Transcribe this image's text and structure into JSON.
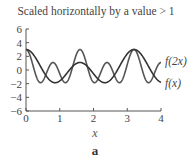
{
  "chart_data": {
    "type": "line",
    "title": "Scaled horizontally by a value > 1",
    "xlabel": "x",
    "ylabel": "",
    "caption": "a",
    "xlim": [
      0,
      4
    ],
    "ylim": [
      -6,
      6
    ],
    "x_ticks": [
      0,
      1,
      2,
      3,
      4
    ],
    "x_tick_labels": [
      "0",
      "1",
      "2",
      "3",
      "4"
    ],
    "y_ticks": [
      6,
      4,
      2,
      0,
      -2,
      -4,
      -6
    ],
    "y_tick_labels": [
      "6",
      "4",
      "2",
      "0",
      "−2",
      "−4",
      "−6"
    ],
    "grid": false,
    "legend_position": "inline-right",
    "x": [
      0,
      0.2,
      0.4,
      0.6,
      0.8,
      1.0,
      1.2,
      1.4,
      1.6,
      1.8,
      2.0,
      2.2,
      2.4,
      2.6,
      2.8,
      3.0,
      3.2,
      3.4,
      3.6,
      3.8,
      4.0
    ],
    "series": [
      {
        "name": "f(2x)",
        "label": "f(2x)",
        "color": "#555555",
        "values": [
          3.0,
          0.15,
          -1.8,
          0.22,
          1.1,
          0.22,
          -1.8,
          0.15,
          3.0,
          0.15,
          -1.8,
          0.22,
          1.1,
          0.22,
          -1.8,
          0.15,
          3.0,
          0.15,
          -1.8,
          0.22,
          1.1
        ]
      },
      {
        "name": "f(x)",
        "label": "f(x)",
        "color": "#333333",
        "values": [
          3.0,
          2.3,
          0.15,
          -1.3,
          -1.8,
          -1.1,
          0.22,
          0.95,
          1.1,
          0.95,
          0.22,
          -1.1,
          -1.8,
          -1.3,
          0.15,
          2.3,
          3.0,
          2.3,
          0.15,
          -1.3,
          -1.8
        ]
      }
    ],
    "model": {
      "f": "1.925*cos(pi*x/0.8) + 0.95*cos(pi*x/1.6) + 0.125"
    }
  }
}
